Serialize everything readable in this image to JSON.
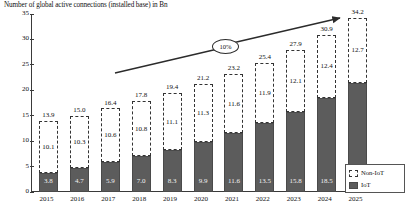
{
  "chart_data": {
    "type": "bar",
    "title": "Number of global active connections (installed base) in Bn",
    "xlabel": "",
    "ylabel": "",
    "ylim": [
      0,
      35
    ],
    "yticks": [
      0,
      5,
      10,
      15,
      20,
      25,
      30,
      35
    ],
    "grid": false,
    "stacked": true,
    "legend_position": "right-bottom",
    "categories": [
      "2015",
      "2016",
      "2017",
      "2018",
      "2019",
      "2020",
      "2021",
      "2022",
      "2023",
      "2024",
      "2025"
    ],
    "series": [
      {
        "name": "IoT",
        "values": [
          3.8,
          4.7,
          5.9,
          7.0,
          8.3,
          9.9,
          11.6,
          13.5,
          15.8,
          18.5,
          21.5
        ]
      },
      {
        "name": "Non-IoT",
        "values": [
          10.1,
          10.3,
          10.6,
          10.8,
          11.1,
          11.3,
          11.6,
          11.9,
          12.1,
          12.4,
          12.7
        ]
      }
    ],
    "totals": [
      13.9,
      15.0,
      16.4,
      17.8,
      19.4,
      21.2,
      23.2,
      25.4,
      27.9,
      30.9,
      34.2
    ],
    "annotations": [
      {
        "name": "cagr-bubble",
        "text": "10%"
      }
    ]
  },
  "legend": {
    "items": [
      {
        "label": "Non-IoT",
        "style": "dashed-outline",
        "color": "#ffffff"
      },
      {
        "label": "IoT",
        "style": "solid-fill",
        "color": "#5c5c5c"
      }
    ]
  },
  "colors": {
    "iot_fill": "#5c5c5c",
    "noniot_fill": "#ffffff",
    "axis": "#3a3a3a",
    "text": "#111111"
  }
}
